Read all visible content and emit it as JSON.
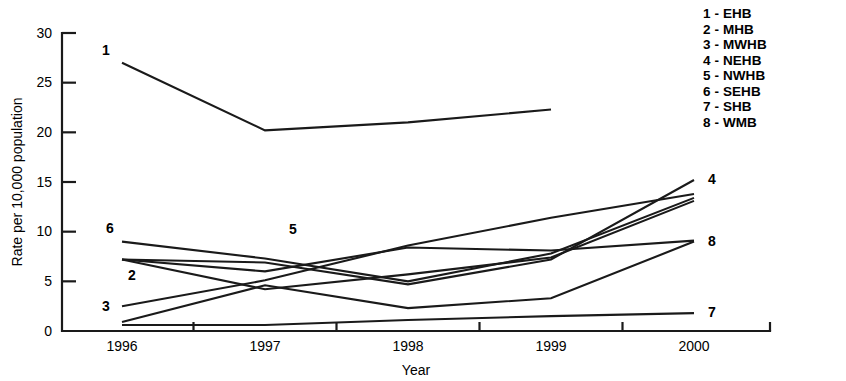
{
  "figure": {
    "name": "line-chart-rate-per-10000-population-by-year"
  },
  "legend": {
    "position": "top-right",
    "items": [
      {
        "number": "1",
        "sep": "-",
        "code": "EHB",
        "label": "1 - EHB"
      },
      {
        "number": "2",
        "sep": "-",
        "code": "MHB",
        "label": "2 - MHB"
      },
      {
        "number": "3",
        "sep": "-",
        "code": "MWHB",
        "label": "3 - MWHB"
      },
      {
        "number": "4",
        "sep": "-",
        "code": "NEHB",
        "label": "4 - NEHB"
      },
      {
        "number": "5",
        "sep": "-",
        "code": "NWHB",
        "label": "5 - NWHB"
      },
      {
        "number": "6",
        "sep": "-",
        "code": "SEHB",
        "label": "6 - SEHB"
      },
      {
        "number": "7",
        "sep": "-",
        "code": "SHB",
        "label": "7 - SHB"
      },
      {
        "number": "8",
        "sep": "-",
        "code": "WMB",
        "label": "8 - WMB"
      }
    ]
  },
  "axes": {
    "y_label": "Rate per 10,000 population",
    "x_label": "Year",
    "y_ticks": [
      "0",
      "5",
      "10",
      "15",
      "20",
      "25",
      "30"
    ],
    "x_ticks": [
      "1996",
      "1997",
      "1998",
      "1999",
      "2000"
    ]
  },
  "chart_data": {
    "type": "line",
    "title": "",
    "xlabel": "Year",
    "ylabel": "Rate per 10,000 population",
    "x": [
      "1996",
      "1997",
      "1998",
      "1999",
      "2000"
    ],
    "xlim": [
      "1996",
      "2000"
    ],
    "ylim": [
      0,
      30
    ],
    "yticks": [
      0,
      5,
      10,
      15,
      20,
      25,
      30
    ],
    "grid": false,
    "legend_position": "top-right",
    "series": [
      {
        "name": "EHB",
        "number": "1",
        "label_text": "1",
        "values": [
          27.0,
          20.2,
          21.0,
          22.3,
          null
        ]
      },
      {
        "name": "MHB",
        "number": "2",
        "label_text": "2",
        "values": [
          7.2,
          4.2,
          5.7,
          7.4,
          13.1
        ]
      },
      {
        "name": "MWHB",
        "number": "3",
        "label_text": "3",
        "values": [
          2.5,
          5.1,
          8.6,
          11.4,
          13.8
        ]
      },
      {
        "name": "NEHB",
        "number": "4",
        "label_text": "4",
        "values": [
          7.2,
          6.9,
          4.7,
          7.2,
          15.2
        ]
      },
      {
        "name": "NWHB",
        "number": "5",
        "label_text": "5",
        "values": [
          7.2,
          6.0,
          8.4,
          8.1,
          9.1
        ]
      },
      {
        "name": "SEHB",
        "number": "6",
        "label_text": "6",
        "values": [
          9.0,
          7.3,
          5.0,
          7.8,
          13.4
        ]
      },
      {
        "name": "SHB",
        "number": "7",
        "label_text": "7",
        "values": [
          0.6,
          0.6,
          1.1,
          1.5,
          1.8
        ]
      },
      {
        "name": "WMB",
        "number": "8",
        "label_text": "8",
        "values": [
          0.9,
          4.6,
          2.3,
          3.3,
          9.0
        ]
      }
    ]
  }
}
